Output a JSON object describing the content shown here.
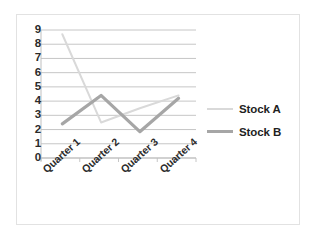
{
  "chart_data": {
    "type": "line",
    "title": "",
    "xlabel": "",
    "ylabel": "",
    "categories": [
      "Quarter 1",
      "Quarter 2",
      "Quarter 3",
      "Quarter 4"
    ],
    "series": [
      {
        "name": "Stock A",
        "color": "#d9d9d9",
        "width": 2.0,
        "values": [
          8.7,
          2.5,
          3.5,
          4.4
        ]
      },
      {
        "name": "Stock B",
        "color": "#a6a6a6",
        "width": 3.2,
        "values": [
          2.4,
          4.4,
          1.85,
          4.2
        ]
      }
    ],
    "ylim": [
      0,
      9
    ],
    "yticks": [
      9,
      8,
      7,
      6,
      5,
      4,
      3,
      2,
      1,
      0
    ],
    "grid": "horizontal",
    "legend_position": "right",
    "plot_background": "#ffffff",
    "grid_color": "#bfbfbf",
    "axis_color": "#bfbfbf",
    "border_color": "#e2e2e2"
  },
  "legend": {
    "items": [
      {
        "label": "Stock A"
      },
      {
        "label": "Stock B"
      }
    ]
  }
}
